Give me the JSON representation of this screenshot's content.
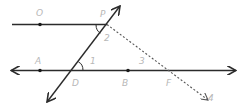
{
  "diagram": {
    "type": "geometry",
    "colors": {
      "line": "#2b2b2b",
      "dashed": "#555555",
      "label": "#b8b8b8"
    },
    "points": {
      "O": {
        "label": "O"
      },
      "P": {
        "label": "P"
      },
      "A": {
        "label": "A"
      },
      "D": {
        "label": "D"
      },
      "B": {
        "label": "B"
      },
      "F": {
        "label": "F"
      }
    },
    "angles": {
      "angle1": {
        "label": "1"
      },
      "angle2": {
        "label": "2"
      },
      "angle3": {
        "label": "3"
      },
      "angle4": {
        "label": "4"
      }
    }
  }
}
